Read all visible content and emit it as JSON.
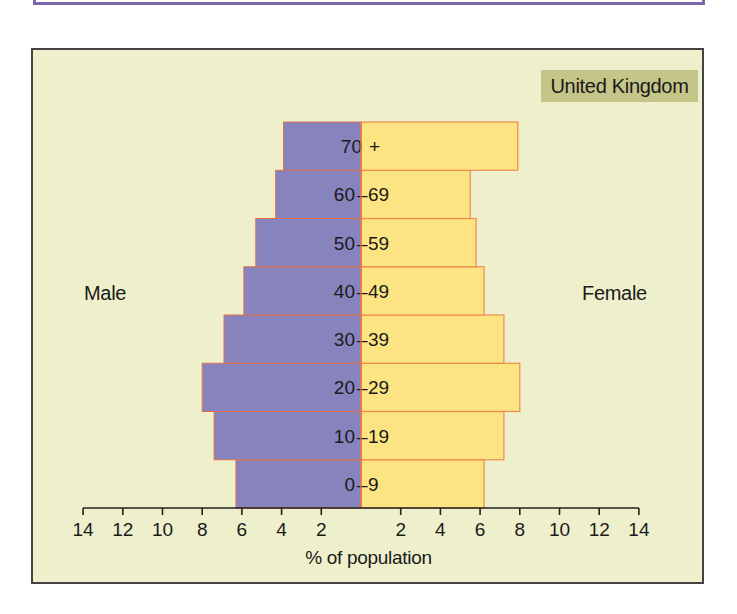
{
  "chart_data": {
    "type": "bar",
    "subtype": "population-pyramid",
    "title": "United Kingdom",
    "xlabel": "% of population",
    "ylabel": "",
    "left_label": "Male",
    "right_label": "Female",
    "categories": [
      "0 – 9",
      "10 – 19",
      "20 – 29",
      "30 – 39",
      "40 – 49",
      "50 – 59",
      "60 – 69",
      "70 +"
    ],
    "series": [
      {
        "name": "Male",
        "color": "#8784bd",
        "values": [
          6.3,
          7.4,
          8.0,
          6.9,
          5.9,
          5.3,
          4.3,
          3.9
        ]
      },
      {
        "name": "Female",
        "color": "#fde483",
        "values": [
          6.2,
          7.2,
          8.0,
          7.2,
          6.2,
          5.8,
          5.5,
          7.9
        ]
      }
    ],
    "xlim": [
      0,
      14
    ],
    "x_ticks_left": [
      "14",
      "12",
      "10",
      "8",
      "6",
      "4",
      "2"
    ],
    "x_ticks_right": [
      "2",
      "4",
      "6",
      "8",
      "10",
      "12",
      "14"
    ],
    "grid": false,
    "orientation": "horizontal"
  },
  "labels": {
    "country": "United Kingdom",
    "male": "Male",
    "female": "Female",
    "axis_title": "% of population"
  }
}
